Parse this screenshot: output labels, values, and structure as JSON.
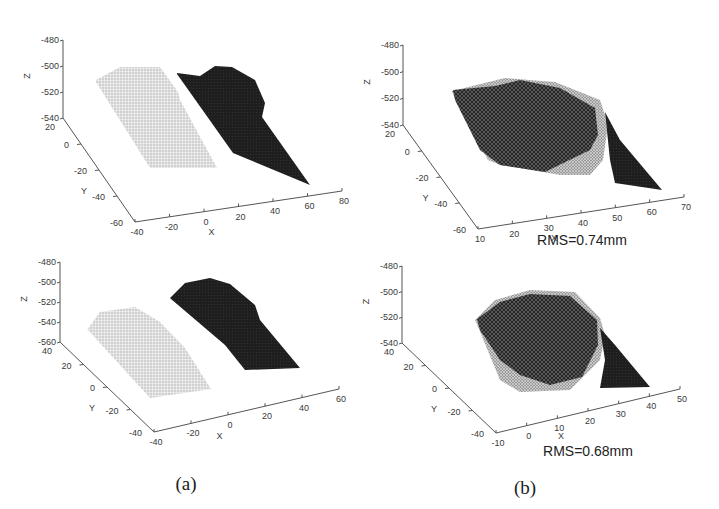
{
  "figure": {
    "captions": [
      "(a)",
      "(b)"
    ]
  },
  "chart_data": [
    {
      "type": "scatter",
      "panel": "a-top",
      "title": "",
      "subplot_caption": "(a)",
      "xlabel": "X",
      "ylabel": "Y",
      "zlabel": "Z",
      "xlim": [
        -40,
        80
      ],
      "ylim": [
        -60,
        20
      ],
      "zlim": [
        -540,
        -480
      ],
      "xticks": [
        -40,
        -20,
        0,
        20,
        40,
        60,
        80
      ],
      "yticks": [
        -60,
        -40,
        -20,
        0,
        20
      ],
      "zticks": [
        -540,
        -520,
        -500,
        -480
      ],
      "grid": false,
      "series": [
        {
          "name": "point cloud (light)",
          "color": "#c8c8c8",
          "x_range": [
            -30,
            20
          ],
          "y_range": [
            -45,
            15
          ],
          "z_approx": -515
        },
        {
          "name": "surface (dark)",
          "color": "#1c1c1c",
          "x_range": [
            15,
            70
          ],
          "y_range": [
            -50,
            10
          ],
          "z_approx": -510
        }
      ],
      "annotation": ""
    },
    {
      "type": "scatter",
      "panel": "b-top",
      "title": "",
      "subplot_caption": "(b)",
      "xlabel": "X",
      "ylabel": "Y",
      "zlabel": "Z",
      "xlim": [
        10,
        70
      ],
      "ylim": [
        -60,
        20
      ],
      "zlim": [
        -540,
        -480
      ],
      "xticks": [
        10,
        20,
        30,
        40,
        50,
        60,
        70
      ],
      "yticks": [
        -60,
        -40,
        -20,
        0,
        20
      ],
      "zticks": [
        -540,
        -520,
        -500,
        -480
      ],
      "grid": false,
      "series": [
        {
          "name": "registered overlay",
          "color": "#1c1c1c",
          "x_range": [
            15,
            65
          ],
          "y_range": [
            -50,
            15
          ],
          "z_approx": -515
        }
      ],
      "annotation": "RMS=0.74mm"
    },
    {
      "type": "scatter",
      "panel": "a-bottom",
      "title": "",
      "subplot_caption": "(a)",
      "xlabel": "X",
      "ylabel": "Y",
      "zlabel": "Z",
      "xlim": [
        -40,
        60
      ],
      "ylim": [
        -40,
        40
      ],
      "zlim": [
        -560,
        -480
      ],
      "xticks": [
        -40,
        -20,
        0,
        20,
        40,
        60
      ],
      "yticks": [
        -40,
        -20,
        0,
        20,
        40
      ],
      "zticks": [
        -560,
        -540,
        -520,
        -500,
        -480
      ],
      "grid": false,
      "series": [
        {
          "name": "point cloud (light)",
          "color": "#c8c8c8",
          "x_range": [
            -30,
            20
          ],
          "y_range": [
            -30,
            30
          ],
          "z_approx": -530
        },
        {
          "name": "surface (dark)",
          "color": "#1c1c1c",
          "x_range": [
            10,
            55
          ],
          "y_range": [
            -30,
            35
          ],
          "z_approx": -510
        }
      ],
      "annotation": ""
    },
    {
      "type": "scatter",
      "panel": "b-bottom",
      "title": "",
      "subplot_caption": "(b)",
      "xlabel": "X",
      "ylabel": "Y",
      "zlabel": "Z",
      "xlim": [
        -10,
        50
      ],
      "ylim": [
        -40,
        40
      ],
      "zlim": [
        -540,
        -480
      ],
      "xticks": [
        -10,
        0,
        10,
        20,
        30,
        40,
        50
      ],
      "yticks": [
        -40,
        -20,
        0,
        20,
        40
      ],
      "zticks": [
        -540,
        -520,
        -500,
        -480
      ],
      "grid": false,
      "series": [
        {
          "name": "registered overlay",
          "color": "#1c1c1c",
          "x_range": [
            0,
            45
          ],
          "y_range": [
            -30,
            35
          ],
          "z_approx": -515
        }
      ],
      "annotation": "RMS=0.68mm"
    }
  ]
}
